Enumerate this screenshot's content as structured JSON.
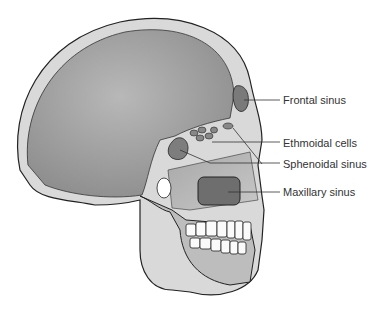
{
  "diagram": {
    "labels": [
      {
        "text": "Frontal sinus",
        "x": 283,
        "y": 94
      },
      {
        "text": "Ethmoidal cells",
        "x": 283,
        "y": 137
      },
      {
        "text": "Sphenoidal sinus",
        "x": 283,
        "y": 158
      },
      {
        "text": "Maxillary sinus",
        "x": 283,
        "y": 186
      }
    ],
    "colors": {
      "bone": "#d8d8d8",
      "cavity": "#8c8c8c",
      "outline": "#222222",
      "label_text": "#333333"
    }
  }
}
